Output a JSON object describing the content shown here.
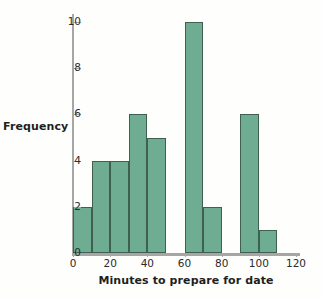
{
  "chart_data": {
    "type": "bar",
    "title": "",
    "xlabel": "Minutes to prepare for date",
    "ylabel": "Frequency",
    "bin_width": 10,
    "bin_starts": [
      0,
      10,
      20,
      30,
      40,
      50,
      60,
      70,
      80,
      90,
      100
    ],
    "categories": [
      "0-10",
      "10-20",
      "20-30",
      "30-40",
      "40-50",
      "50-60",
      "60-70",
      "70-80",
      "80-90",
      "90-100",
      "100-110"
    ],
    "values": [
      2,
      4,
      4,
      6,
      5,
      0,
      10,
      2,
      0,
      6,
      1
    ],
    "xlim": [
      0,
      120
    ],
    "ylim": [
      0,
      10
    ],
    "x_ticks": [
      0,
      20,
      40,
      60,
      80,
      100,
      120
    ],
    "x_tick_labels": [
      "0",
      "20",
      "40",
      "60",
      "80",
      "100",
      "120"
    ],
    "y_ticks": [
      0,
      2,
      4,
      6,
      8,
      10
    ],
    "y_tick_labels": [
      "0",
      "2",
      "4",
      "6",
      "8",
      "10"
    ],
    "grid": false,
    "legend": null,
    "bar_fill_color": "#6fad92",
    "bar_border_color": "#3f5f51",
    "axis_color": "#a6a6a6",
    "background_color": "#fefefc"
  }
}
